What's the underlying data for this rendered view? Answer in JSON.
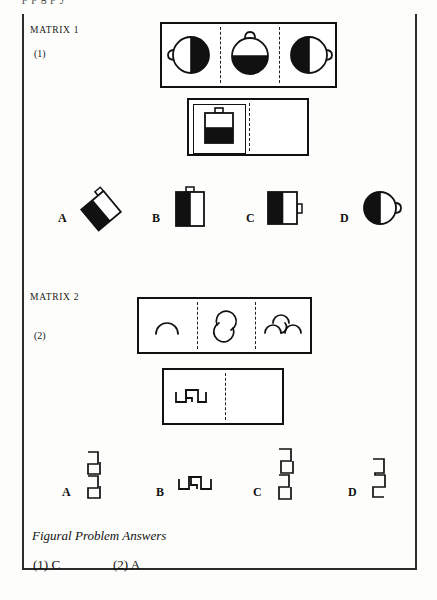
{
  "page": {
    "cut_header_text": "p                                p g              p y",
    "border_color": "#2b2b2b"
  },
  "matrix1": {
    "label": "MATRIX 1",
    "number": "(1)",
    "row1": {
      "cells": [
        {
          "name": "circle-handle-left-white-right-black",
          "description": "circle with handle on left, left half white right half black"
        },
        {
          "name": "circle-handle-top-bottom-black",
          "description": "circle with handle on top, bottom half black"
        },
        {
          "name": "circle-handle-right-left-black",
          "description": "circle with handle on right, left half black right half white"
        }
      ]
    },
    "row2": {
      "cells": [
        {
          "name": "square-bag-handle-top-bottom-black",
          "description": "square bag with handle on top, bottom half black, inside inner frame"
        },
        {
          "name": "empty-cell",
          "description": "blank answer cell"
        }
      ]
    },
    "options": [
      {
        "letter": "A",
        "name": "rotated-square-bag-left-black",
        "description": "square bag rotated 45 degrees, lower-left half black, handle upper right"
      },
      {
        "letter": "B",
        "name": "tall-rect-bag-handle-top-left-black",
        "description": "tall rectangle bag with handle on top, left half black"
      },
      {
        "letter": "C",
        "name": "square-bag-handle-right-left-black",
        "description": "square bag with handle on right side, left half black"
      },
      {
        "letter": "D",
        "name": "circle-bag-handle-right-left-black",
        "description": "circle with handle on right, left half black"
      }
    ]
  },
  "matrix2": {
    "label": "MATRIX 2",
    "number": "(2)",
    "row1": {
      "cells": [
        {
          "name": "single-arc",
          "description": "single downward-opening arc"
        },
        {
          "name": "double-arc-s-curve",
          "description": "two arcs forming an S / spiral curve"
        },
        {
          "name": "triple-arc-wave",
          "description": "three arcs forming a wave"
        }
      ]
    },
    "row2": {
      "cells": [
        {
          "name": "bracket-step-shape",
          "description": "square bracket step shape pointing up"
        },
        {
          "name": "empty-cell",
          "description": "blank answer cell"
        }
      ]
    },
    "options": [
      {
        "letter": "A",
        "name": "vertical-double-bracket-zigzag",
        "description": "vertical stacked double bracket zigzag"
      },
      {
        "letter": "B",
        "name": "horizontal-bracket-step",
        "description": "horizontal bracket step shape"
      },
      {
        "letter": "C",
        "name": "vertical-tall-bracket-zigzag",
        "description": "taller vertical bracket zigzag"
      },
      {
        "letter": "D",
        "name": "vertical-short-bracket-zigzag",
        "description": "short vertical bracket zigzag"
      }
    ]
  },
  "answers": {
    "title": "Figural Problem Answers",
    "entries": [
      {
        "label": "(1) C"
      },
      {
        "label": "(2) A"
      }
    ]
  }
}
